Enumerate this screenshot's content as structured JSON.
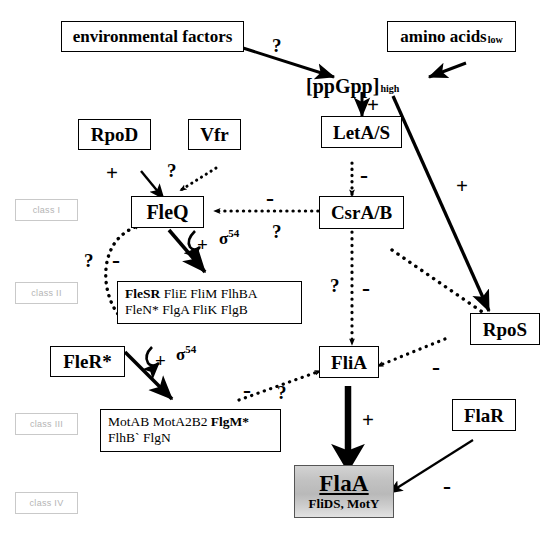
{
  "figure": {
    "background": "#ffffff",
    "line_color": "#000000",
    "class_label_color": "#b4b4b4",
    "highlight_fill": "#c2c2c2"
  },
  "nodes": {
    "environmental_factors": "environmental factors",
    "amino_acids": "amino acids",
    "amino_acids_sub": "low",
    "ppgpp": "[ppGpp]",
    "ppgpp_sub": "high",
    "leta_s": "LetA/S",
    "rpod": "RpoD",
    "vfr": "Vfr",
    "fleq": "FleQ",
    "csra_b": "CsrA/B",
    "rpos": "RpoS",
    "fler": "FleR*",
    "flia": "FliA",
    "flar": "FlaR",
    "flaa_main": "FlaA",
    "flaa_sub": "FliDS, MotY"
  },
  "class_labels": {
    "class1": "class I",
    "class2": "class II",
    "class3": "class III",
    "class4": "class IV"
  },
  "gene_boxes": {
    "class2": {
      "row1": [
        {
          "text": "FleSR",
          "bold": true
        },
        {
          "text": "FliE",
          "bold": false
        },
        {
          "text": "FliM",
          "bold": false
        },
        {
          "text": "FlhBA",
          "bold": false
        }
      ],
      "row2": [
        {
          "text": "FleN*",
          "bold": false
        },
        {
          "text": "FlgA",
          "bold": false
        },
        {
          "text": "FliK",
          "bold": false
        },
        {
          "text": "FlgB",
          "bold": false
        }
      ]
    },
    "class3": {
      "row1": [
        {
          "text": "MotAB",
          "bold": false
        },
        {
          "text": "MotA2B2",
          "bold": false
        },
        {
          "text": "FlgM*",
          "bold": true
        }
      ],
      "row2": [
        {
          "text": "FlhB`",
          "bold": false
        },
        {
          "text": "FlgN",
          "bold": false
        }
      ]
    }
  },
  "edge_labels": {
    "env_to_ppgpp": "?",
    "ppgpp_to_leta": "+",
    "leta_to_csra": "-",
    "ppgpp_to_rpos": "+",
    "rpod_to_fleq": "+",
    "vfr_to_fleq": "?",
    "csra_to_fleq_minus": "-",
    "csra_to_fleq_q": "?",
    "fleq_sigma_plus": "+",
    "fleq_sigma": "σ",
    "fleq_sigma_sup": "54",
    "class2_to_fleq_q": "?",
    "class2_to_fleq_minus": "-",
    "csra_to_flia_q": "?",
    "csra_to_flia_minus": "-",
    "fler_sigma_plus": "+",
    "fler_sigma": "σ",
    "fler_sigma_sup": "54",
    "class3_to_flia_minus": "-",
    "class3_to_flia_q": "?",
    "rpos_to_flia_minus": "-",
    "flia_to_flaa": "+",
    "flar_to_flaa": "-"
  },
  "caption": ""
}
